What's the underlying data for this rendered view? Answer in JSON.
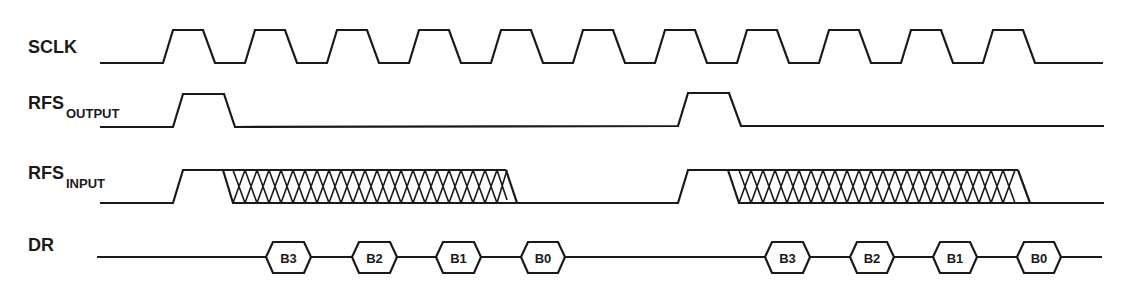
{
  "signals": {
    "sclk": {
      "label": "SCLK",
      "subscript": ""
    },
    "rfs_output": {
      "label": "RFS",
      "subscript": "OUTPUT"
    },
    "rfs_input": {
      "label": "RFS",
      "subscript": "INPUT"
    },
    "dr": {
      "label": "DR",
      "subscript": ""
    }
  },
  "dr_bits": {
    "frame1": [
      "B3",
      "B2",
      "B1",
      "B0"
    ],
    "frame2": [
      "B3",
      "B2",
      "B1",
      "B0"
    ]
  },
  "colors": {
    "line": "#1a1a1a",
    "background": "#ffffff"
  }
}
